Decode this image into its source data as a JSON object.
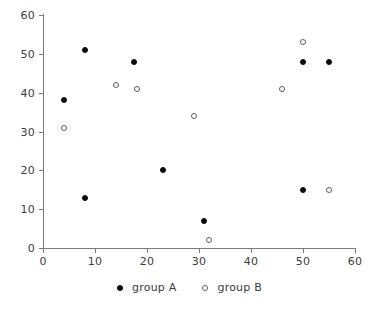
{
  "chart_data": {
    "type": "scatter",
    "title": "",
    "xlabel": "",
    "ylabel": "",
    "xlim": [
      0,
      60
    ],
    "ylim": [
      0,
      60
    ],
    "xticks": [
      0,
      10,
      20,
      30,
      40,
      50,
      60
    ],
    "yticks": [
      0,
      10,
      20,
      30,
      40,
      50,
      60
    ],
    "xtick_labels": [
      "0",
      "10",
      "20",
      "30",
      "40",
      "50",
      "60"
    ],
    "ytick_labels": [
      "0",
      "10",
      "20",
      "30",
      "40",
      "50",
      "60"
    ],
    "grid": false,
    "legend_position": "bottom-center",
    "series": [
      {
        "name": "group A",
        "marker": "filled-circle",
        "color": "#0a0a0a",
        "points": [
          {
            "x": 4,
            "y": 38
          },
          {
            "x": 8,
            "y": 51
          },
          {
            "x": 8,
            "y": 13
          },
          {
            "x": 17.5,
            "y": 48
          },
          {
            "x": 23,
            "y": 20
          },
          {
            "x": 31,
            "y": 7
          },
          {
            "x": 50,
            "y": 48
          },
          {
            "x": 50,
            "y": 15
          },
          {
            "x": 55,
            "y": 48
          }
        ]
      },
      {
        "name": "group B",
        "marker": "open-circle",
        "color": "#5d5d5d",
        "points": [
          {
            "x": 4,
            "y": 31
          },
          {
            "x": 14,
            "y": 42
          },
          {
            "x": 18,
            "y": 41
          },
          {
            "x": 29,
            "y": 34
          },
          {
            "x": 32,
            "y": 2
          },
          {
            "x": 46,
            "y": 41
          },
          {
            "x": 50,
            "y": 53
          },
          {
            "x": 55,
            "y": 15
          }
        ]
      }
    ]
  },
  "legend": {
    "entries": [
      {
        "label": "group A",
        "marker": "filled-circle"
      },
      {
        "label": "group B",
        "marker": "open-circle"
      }
    ]
  }
}
